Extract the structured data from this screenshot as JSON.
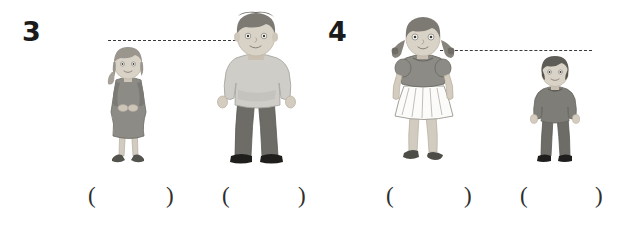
{
  "page": {
    "background_color": "#ffffff",
    "width": 632,
    "height": 228,
    "type": "worksheet-height-comparison"
  },
  "palette": {
    "ink": "#1b1b1b",
    "dash_line": "#3a3a3a",
    "skin": "#d9d2c6",
    "skin_shade": "#c9c0b2",
    "hair_light": "#9a968e",
    "hair_mid": "#7d7a73",
    "hair_dark": "#5e5c57",
    "garment_light": "#cfcdc7",
    "garment_mid": "#8d8b85",
    "garment_dark": "#6e6c67",
    "skirt_white": "#fbfbf9",
    "shoe_dark": "#2b2a28",
    "outline": "#6a6861"
  },
  "problems": [
    {
      "number": "3",
      "number_x": 22,
      "number_y": 18,
      "height_line": {
        "x": 108,
        "y": 40,
        "width": 163,
        "style": "dashed"
      },
      "figures": [
        {
          "name": "short-girl",
          "label": "girl in grey dress",
          "x": 100,
          "y": 46,
          "width": 56,
          "height": 124,
          "taller": false
        },
        {
          "name": "tall-man",
          "label": "man in light sweater",
          "x": 214,
          "y": 12,
          "width": 84,
          "height": 158,
          "taller": true
        }
      ],
      "answer_slots": [
        {
          "name": "answer-slot-1",
          "open_x": 88,
          "close_x": 166,
          "open": "(",
          "close": ")",
          "value": ""
        },
        {
          "name": "answer-slot-2",
          "open_x": 222,
          "close_x": 298,
          "open": "(",
          "close": ")",
          "value": ""
        }
      ]
    },
    {
      "number": "4",
      "number_x": 328,
      "number_y": 18,
      "height_line": {
        "x": 440,
        "y": 50,
        "width": 152,
        "style": "dashed"
      },
      "figures": [
        {
          "name": "tall-girl",
          "label": "girl with braids and pleated skirt",
          "x": 382,
          "y": 16,
          "width": 80,
          "height": 154,
          "taller": true
        },
        {
          "name": "short-boy",
          "label": "boy in grey outfit",
          "x": 528,
          "y": 56,
          "width": 54,
          "height": 114,
          "taller": false
        }
      ],
      "answer_slots": [
        {
          "name": "answer-slot-3",
          "open_x": 386,
          "close_x": 464,
          "open": "(",
          "close": ")",
          "value": ""
        },
        {
          "name": "answer-slot-4",
          "open_x": 520,
          "close_x": 595,
          "open": "(",
          "close": ")",
          "value": ""
        }
      ]
    }
  ]
}
